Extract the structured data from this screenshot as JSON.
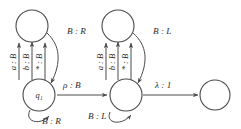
{
  "diagram": {
    "type": "state-transition-diagram",
    "canvas": {
      "width": 241,
      "height": 129
    },
    "colors": {
      "background": "#ffffff",
      "stroke": "#4a4a4a",
      "text": "#2b2b2b"
    },
    "states": [
      {
        "id": "top-left",
        "label": "",
        "cx": 32,
        "cy": 26,
        "r": 16,
        "accepting": false
      },
      {
        "id": "q1",
        "label": "q₁",
        "cx": 39,
        "cy": 95,
        "r": 16,
        "accepting": false
      },
      {
        "id": "top-right",
        "label": "",
        "cx": 118,
        "cy": 26,
        "r": 16,
        "accepting": false
      },
      {
        "id": "middle",
        "label": "",
        "cx": 126,
        "cy": 95,
        "r": 16,
        "accepting": false
      },
      {
        "id": "final",
        "label": "",
        "cx": 215,
        "cy": 95,
        "r": 15,
        "accepting": false
      }
    ],
    "transitions": [
      {
        "id": "t1",
        "from": "q1",
        "to": "top-left",
        "label": "a : B",
        "orientation": "vertical",
        "group": "left-gadget"
      },
      {
        "id": "t2",
        "from": "q1",
        "to": "top-left",
        "label": "b : B",
        "orientation": "vertical",
        "group": "left-gadget"
      },
      {
        "id": "t3",
        "from": "q1",
        "to": "top-left",
        "label": "* : B",
        "orientation": "vertical",
        "group": "left-gadget"
      },
      {
        "id": "t4",
        "from": "top-left",
        "to": "q1",
        "label": "B : R",
        "orientation": "arc-right",
        "group": "left-gadget"
      },
      {
        "id": "t5",
        "from": "q1",
        "to": "q1",
        "label": "B : R",
        "orientation": "self-loop-bottom",
        "group": "left-gadget"
      },
      {
        "id": "t6",
        "from": "q1",
        "to": "middle",
        "label": "ρ : B",
        "orientation": "horizontal",
        "group": "link"
      },
      {
        "id": "t7",
        "from": "middle",
        "to": "top-right",
        "label": "a : B",
        "orientation": "vertical",
        "group": "right-gadget"
      },
      {
        "id": "t8",
        "from": "middle",
        "to": "top-right",
        "label": "b : B",
        "orientation": "vertical",
        "group": "right-gadget"
      },
      {
        "id": "t9",
        "from": "middle",
        "to": "top-right",
        "label": "* : B",
        "orientation": "vertical",
        "group": "right-gadget"
      },
      {
        "id": "t10",
        "from": "top-right",
        "to": "middle",
        "label": "B : L",
        "orientation": "arc-right",
        "group": "right-gadget"
      },
      {
        "id": "t11",
        "from": "middle",
        "to": "middle",
        "label": "B : L",
        "orientation": "self-loop-bottom",
        "group": "right-gadget"
      },
      {
        "id": "t12",
        "from": "middle",
        "to": "final",
        "label": "λ : 1",
        "orientation": "horizontal",
        "group": "link"
      }
    ],
    "labels": {
      "a_b": "a : B",
      "b_b": "b : B",
      "star_b": "* : B",
      "b_r": "B : R",
      "b_l": "B : L",
      "rho_b": "ρ : B",
      "lambda_1": "λ : 1",
      "q1": "q₁"
    }
  }
}
